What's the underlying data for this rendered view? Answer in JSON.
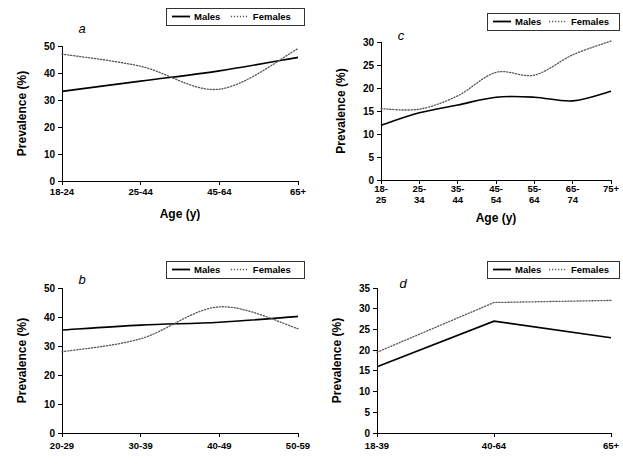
{
  "figure": {
    "legend": {
      "males_label": "Males",
      "females_label": "Females"
    },
    "series_colors": {
      "males": "#000000",
      "females": "#555555"
    }
  },
  "chart_data": [
    {
      "id": "a",
      "panel_letter": "a",
      "type": "line",
      "title": "",
      "xlabel": "Age (y)",
      "ylabel": "Prevalence (%)",
      "categories": [
        "18-24",
        "25-44",
        "45-64",
        "65+"
      ],
      "xticks": [
        "18-24",
        "25-44",
        "45-64",
        "65+"
      ],
      "yticks": [
        0,
        10,
        20,
        30,
        40,
        50
      ],
      "ylim": [
        0,
        50
      ],
      "grid": false,
      "legend_position": "top-right",
      "series": [
        {
          "name": "Males",
          "values": [
            33.2,
            37.0,
            40.8,
            45.8
          ]
        },
        {
          "name": "Females",
          "values": [
            47.0,
            42.5,
            34.0,
            49.0
          ]
        }
      ]
    },
    {
      "id": "c",
      "panel_letter": "c",
      "type": "line",
      "title": "",
      "xlabel": "Age (y)",
      "ylabel": "Prevalence (%)",
      "categories": [
        "18-25",
        "25-34",
        "35-44",
        "45-54",
        "55-64",
        "65-74",
        "75+"
      ],
      "xticks": [
        "18-\n25",
        "25-\n34",
        "35-\n44",
        "45-\n54",
        "55-\n64",
        "65-\n74",
        "75+"
      ],
      "yticks": [
        0,
        5,
        10,
        15,
        20,
        25,
        30
      ],
      "ylim": [
        0,
        30
      ],
      "grid": false,
      "legend_position": "top-right",
      "series": [
        {
          "name": "Males",
          "values": [
            11.9,
            14.6,
            16.3,
            18.0,
            18.0,
            17.2,
            19.3
          ]
        },
        {
          "name": "Females",
          "values": [
            15.5,
            15.4,
            18.3,
            23.4,
            22.8,
            27.2,
            30.2
          ]
        }
      ]
    },
    {
      "id": "b",
      "panel_letter": "b",
      "type": "line",
      "title": "",
      "xlabel": "",
      "ylabel": "Prevalence (%)",
      "categories": [
        "20-29",
        "30-39",
        "40-49",
        "50-59"
      ],
      "xticks": [
        "20-29",
        "30-39",
        "40-49",
        "50-59"
      ],
      "yticks": [
        0,
        10,
        20,
        30,
        40,
        50
      ],
      "ylim": [
        0,
        50
      ],
      "grid": false,
      "legend_position": "top-right",
      "series": [
        {
          "name": "Males",
          "values": [
            35.5,
            37.2,
            38.2,
            40.2
          ]
        },
        {
          "name": "Females",
          "values": [
            28.0,
            32.5,
            43.5,
            36.0
          ]
        }
      ]
    },
    {
      "id": "d",
      "panel_letter": "d",
      "type": "line",
      "title": "",
      "xlabel": "",
      "ylabel": "Prevalence (%)",
      "categories": [
        "18-39",
        "40-64",
        "65+"
      ],
      "xticks": [
        "18-39",
        "40-64",
        "65+"
      ],
      "yticks": [
        0,
        5,
        10,
        15,
        20,
        25,
        30,
        35
      ],
      "ylim": [
        0,
        35
      ],
      "grid": false,
      "legend_position": "top-right",
      "series": [
        {
          "name": "Males",
          "values": [
            16.0,
            27.0,
            23.0
          ]
        },
        {
          "name": "Females",
          "values": [
            19.5,
            31.5,
            32.0
          ]
        }
      ]
    }
  ]
}
